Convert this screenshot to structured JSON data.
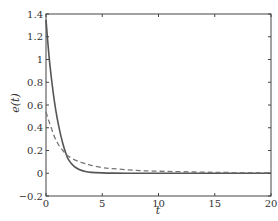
{
  "chart_data": {
    "type": "line",
    "title": "",
    "xlabel": "t",
    "ylabel": "e(t)",
    "xlim": [
      0,
      20
    ],
    "ylim": [
      -0.2,
      1.4
    ],
    "xticks": [
      0,
      5,
      10,
      15,
      20
    ],
    "yticks": [
      -0.2,
      0,
      0.2,
      0.4,
      0.6,
      0.8,
      1,
      1.2,
      1.4
    ],
    "xtick_labels": [
      "0",
      "5",
      "10",
      "15",
      "20"
    ],
    "ytick_labels": [
      "−0.2",
      "0",
      "0.2",
      "0.4",
      "0.6",
      "0.8",
      "1",
      "1.2",
      "1.4"
    ],
    "grid": false,
    "legend": null,
    "series": [
      {
        "name": "solid",
        "style": "solid",
        "color": "#555555",
        "x": [
          0,
          0.25,
          0.5,
          0.75,
          1,
          1.25,
          1.5,
          1.75,
          2,
          2.5,
          3,
          3.5,
          4,
          5,
          6,
          8,
          10,
          15,
          20
        ],
        "values": [
          1.35,
          1.05,
          0.82,
          0.63,
          0.48,
          0.36,
          0.26,
          0.18,
          0.12,
          0.06,
          0.03,
          0.015,
          0.008,
          0.003,
          0.001,
          0.0,
          0.0,
          0.0,
          0.0
        ]
      },
      {
        "name": "dashed",
        "style": "dashed",
        "color": "#777777",
        "x": [
          0,
          0.25,
          0.5,
          0.75,
          1,
          1.25,
          1.5,
          1.75,
          2,
          2.5,
          3,
          3.5,
          4,
          5,
          6,
          8,
          10,
          15,
          20
        ],
        "values": [
          0.54,
          0.46,
          0.39,
          0.32,
          0.27,
          0.23,
          0.2,
          0.17,
          0.15,
          0.12,
          0.1,
          0.085,
          0.07,
          0.05,
          0.04,
          0.025,
          0.018,
          0.008,
          0.004
        ]
      }
    ]
  },
  "layout": {
    "plot_left": 46,
    "plot_right": 271,
    "plot_top": 14,
    "plot_bottom": 196
  }
}
